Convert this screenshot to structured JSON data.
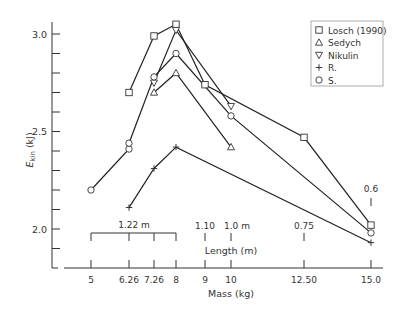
{
  "chart_data": {
    "type": "line",
    "title": "",
    "xlabel": "Mass (kg)",
    "ylabel": "E_kin (kJ)",
    "ylabel_main": "E",
    "ylabel_sub": "kin",
    "ylabel_unit": " (kJ)",
    "secondary_xlabel": "Length (m)",
    "ylim": [
      1.85,
      3.07
    ],
    "y_ticks": [
      2.0,
      2.5,
      3.0
    ],
    "y_minor_step": 0.1,
    "x_ticks": [
      5,
      6.26,
      7.26,
      8,
      9,
      10,
      12.5,
      15.0
    ],
    "x_tick_labels": [
      "5",
      "6.26",
      "7.26",
      "8",
      "9",
      "10",
      "12.50",
      "15.0"
    ],
    "length_annotations": [
      {
        "label": "1.22 m",
        "bracket": [
          5,
          6.26,
          7.26,
          8
        ]
      },
      {
        "label": "1.10",
        "x": 9
      },
      {
        "label": "1.0 m",
        "x": 10
      },
      {
        "label": "0.75",
        "x": 12.5
      },
      {
        "label": "0.6",
        "x": 15.0
      }
    ],
    "grid": false,
    "legend_position": "upper right",
    "series": [
      {
        "name": "Losch (1990)",
        "marker": "square",
        "x": [
          6.26,
          7.26,
          8,
          9,
          12.5,
          15.0
        ],
        "y": [
          2.7,
          2.99,
          3.05,
          2.74,
          2.47,
          2.02
        ]
      },
      {
        "name": "Sedych",
        "marker": "triangle-up",
        "x": [
          7.26,
          8,
          10
        ],
        "y": [
          2.7,
          2.8,
          2.42
        ]
      },
      {
        "name": "Nikulin",
        "marker": "triangle-down",
        "x": [
          7.26,
          8,
          10
        ],
        "y": [
          2.75,
          3.02,
          2.63
        ]
      },
      {
        "name": "R.",
        "marker": "plus",
        "x": [
          6.26,
          7.26,
          8,
          15.0
        ],
        "y": [
          2.11,
          2.31,
          2.42,
          1.93
        ]
      },
      {
        "name": "S.",
        "marker": "circle",
        "x": [
          5,
          6.26,
          6.26,
          7.26,
          8,
          10,
          15.0
        ],
        "y": [
          2.2,
          2.41,
          2.44,
          2.78,
          2.9,
          2.58,
          1.98
        ]
      }
    ]
  }
}
